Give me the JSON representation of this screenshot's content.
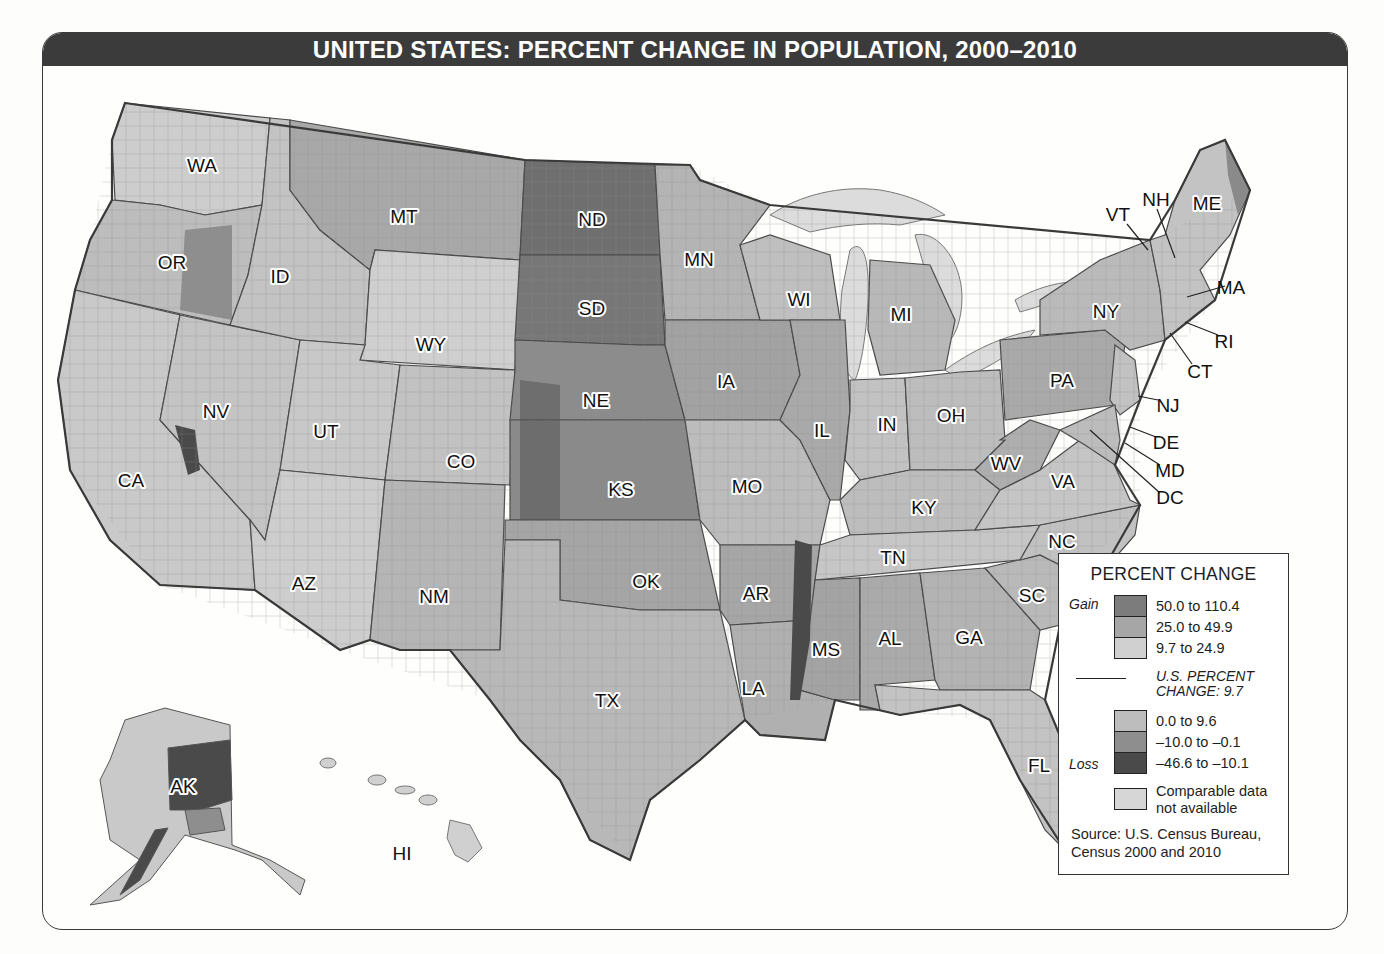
{
  "title": "UNITED STATES: PERCENT CHANGE IN POPULATION, 2000–2010",
  "colors": {
    "title_bar": "#3b3b3b",
    "gain_50_110": "#7c7c7c",
    "gain_25_50": "#a6a6a6",
    "gain_10_25": "#cfcfcf",
    "low_0_10": "#bdbdbd",
    "loss_10_0": "#8e8e8e",
    "loss_47_10": "#4a4a4a",
    "na": "#d6d6d6",
    "water": "#dcdcdc"
  },
  "legend": {
    "title": "PERCENT CHANGE",
    "gain_label": "Gain",
    "loss_label": "Loss",
    "items": [
      {
        "label": "50.0 to 110.4",
        "color": "#7c7c7c"
      },
      {
        "label": "25.0 to 49.9",
        "color": "#a6a6a6"
      },
      {
        "label": "9.7 to 24.9",
        "color": "#d0d0d0"
      },
      {
        "label": "0.0 to 9.6",
        "color": "#bdbdbd"
      },
      {
        "label": "–10.0 to –0.1",
        "color": "#8e8e8e"
      },
      {
        "label": "–46.6 to –10.1",
        "color": "#4a4a4a"
      }
    ],
    "us_change_line1": "U.S. PERCENT",
    "us_change_line2": "CHANGE: 9.7",
    "na_label_line1": "Comparable data",
    "na_label_line2": "not available",
    "source_line1": "Source: U.S. Census Bureau,",
    "source_line2": "Census 2000 and 2010"
  },
  "states": [
    {
      "abbr": "WA",
      "x": 202,
      "y": 165
    },
    {
      "abbr": "OR",
      "x": 172,
      "y": 262
    },
    {
      "abbr": "ID",
      "x": 280,
      "y": 276
    },
    {
      "abbr": "MT",
      "x": 404,
      "y": 216
    },
    {
      "abbr": "WY",
      "x": 431,
      "y": 344
    },
    {
      "abbr": "NV",
      "x": 216,
      "y": 411
    },
    {
      "abbr": "UT",
      "x": 326,
      "y": 431
    },
    {
      "abbr": "CA",
      "x": 131,
      "y": 480
    },
    {
      "abbr": "CO",
      "x": 461,
      "y": 461
    },
    {
      "abbr": "AZ",
      "x": 304,
      "y": 583
    },
    {
      "abbr": "NM",
      "x": 434,
      "y": 596
    },
    {
      "abbr": "ND",
      "x": 592,
      "y": 219
    },
    {
      "abbr": "SD",
      "x": 592,
      "y": 308
    },
    {
      "abbr": "NE",
      "x": 596,
      "y": 400
    },
    {
      "abbr": "KS",
      "x": 621,
      "y": 489
    },
    {
      "abbr": "OK",
      "x": 646,
      "y": 581
    },
    {
      "abbr": "TX",
      "x": 607,
      "y": 700
    },
    {
      "abbr": "MN",
      "x": 699,
      "y": 259
    },
    {
      "abbr": "IA",
      "x": 726,
      "y": 381
    },
    {
      "abbr": "MO",
      "x": 747,
      "y": 486
    },
    {
      "abbr": "AR",
      "x": 756,
      "y": 593
    },
    {
      "abbr": "LA",
      "x": 753,
      "y": 688
    },
    {
      "abbr": "WI",
      "x": 799,
      "y": 299
    },
    {
      "abbr": "IL",
      "x": 822,
      "y": 430
    },
    {
      "abbr": "MI",
      "x": 901,
      "y": 314
    },
    {
      "abbr": "IN",
      "x": 887,
      "y": 424
    },
    {
      "abbr": "OH",
      "x": 951,
      "y": 415
    },
    {
      "abbr": "KY",
      "x": 924,
      "y": 507
    },
    {
      "abbr": "TN",
      "x": 893,
      "y": 557
    },
    {
      "abbr": "MS",
      "x": 826,
      "y": 649
    },
    {
      "abbr": "AL",
      "x": 890,
      "y": 638
    },
    {
      "abbr": "GA",
      "x": 969,
      "y": 637
    },
    {
      "abbr": "FL",
      "x": 1039,
      "y": 765
    },
    {
      "abbr": "SC",
      "x": 1032,
      "y": 595
    },
    {
      "abbr": "NC",
      "x": 1062,
      "y": 541
    },
    {
      "abbr": "VA",
      "x": 1063,
      "y": 481
    },
    {
      "abbr": "WV",
      "x": 1006,
      "y": 463
    },
    {
      "abbr": "PA",
      "x": 1062,
      "y": 380
    },
    {
      "abbr": "NY",
      "x": 1106,
      "y": 311
    },
    {
      "abbr": "ME",
      "x": 1207,
      "y": 203
    },
    {
      "abbr": "AK",
      "x": 183,
      "y": 786
    },
    {
      "abbr": "HI",
      "x": 402,
      "y": 853
    }
  ],
  "leader_labels": [
    {
      "abbr": "VT",
      "x": 1118,
      "y": 214
    },
    {
      "abbr": "NH",
      "x": 1156,
      "y": 199
    },
    {
      "abbr": "MA",
      "x": 1231,
      "y": 287
    },
    {
      "abbr": "RI",
      "x": 1224,
      "y": 341
    },
    {
      "abbr": "CT",
      "x": 1200,
      "y": 371
    },
    {
      "abbr": "NJ",
      "x": 1168,
      "y": 405
    },
    {
      "abbr": "DE",
      "x": 1166,
      "y": 442
    },
    {
      "abbr": "MD",
      "x": 1170,
      "y": 470
    },
    {
      "abbr": "DC",
      "x": 1170,
      "y": 497
    }
  ],
  "chart_data": {
    "type": "choropleth",
    "title": "UNITED STATES: PERCENT CHANGE IN POPULATION, 2000–2010",
    "unit": "percent change by county",
    "us_average": 9.7,
    "classes": [
      {
        "group": "Gain",
        "range": [
          50.0,
          110.4
        ],
        "label": "50.0 to 110.4"
      },
      {
        "group": "Gain",
        "range": [
          25.0,
          49.9
        ],
        "label": "25.0 to 49.9"
      },
      {
        "group": "Gain",
        "range": [
          9.7,
          24.9
        ],
        "label": "9.7 to 24.9"
      },
      {
        "group": "Loss",
        "range": [
          0.0,
          9.6
        ],
        "label": "0.0 to 9.6"
      },
      {
        "group": "Loss",
        "range": [
          -10.0,
          -0.1
        ],
        "label": "–10.0 to –0.1"
      },
      {
        "group": "Loss",
        "range": [
          -46.6,
          -10.1
        ],
        "label": "–46.6 to –10.1"
      },
      {
        "group": "NA",
        "label": "Comparable data not available"
      }
    ],
    "legend_position": "bottom-right",
    "source": "U.S. Census Bureau, Census 2000 and 2010"
  }
}
